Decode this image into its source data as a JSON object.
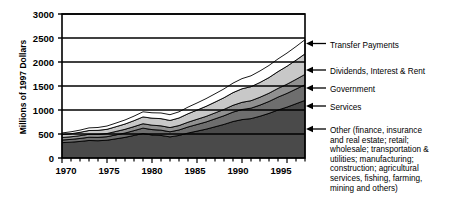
{
  "chart_data": {
    "type": "area",
    "stacked": true,
    "title": "",
    "xlabel": "",
    "ylabel": "Millions of 1997 Dollars",
    "xlim": [
      1970,
      1997
    ],
    "ylim": [
      0,
      3000
    ],
    "grid": true,
    "legend_position": "right-callout",
    "x": [
      1970,
      1971,
      1972,
      1973,
      1974,
      1975,
      1976,
      1977,
      1978,
      1979,
      1980,
      1981,
      1982,
      1983,
      1984,
      1985,
      1986,
      1987,
      1988,
      1989,
      1990,
      1991,
      1992,
      1993,
      1994,
      1995,
      1996,
      1997
    ],
    "y_ticks": [
      0,
      500,
      1000,
      1500,
      2000,
      2500,
      3000
    ],
    "x_ticks": [
      1970,
      1975,
      1980,
      1985,
      1990,
      1995
    ],
    "series": [
      {
        "name": "Other (finance, insurance and real estate; retail; wholesale; transportation & utilities; manufacturing; construction; agricultural services, fishing, farming, mining and others)",
        "short_name": "Other",
        "color": "#4a4a4a",
        "values": [
          320,
          330,
          345,
          365,
          360,
          370,
          400,
          430,
          470,
          510,
          480,
          470,
          440,
          470,
          520,
          560,
          600,
          650,
          700,
          760,
          800,
          820,
          870,
          930,
          1000,
          1060,
          1130,
          1200
        ]
      },
      {
        "name": "Services",
        "short_name": "Services",
        "color": "#6e6e6e",
        "values": [
          55,
          58,
          62,
          68,
          70,
          74,
          82,
          90,
          100,
          112,
          112,
          110,
          106,
          114,
          126,
          138,
          150,
          165,
          180,
          196,
          210,
          218,
          232,
          248,
          268,
          286,
          306,
          328
        ]
      },
      {
        "name": "Government",
        "short_name": "Government",
        "color": "#909090",
        "values": [
          52,
          54,
          58,
          62,
          64,
          66,
          72,
          78,
          84,
          92,
          92,
          90,
          88,
          92,
          100,
          108,
          116,
          124,
          132,
          142,
          150,
          156,
          164,
          172,
          182,
          192,
          202,
          214
        ]
      },
      {
        "name": "Dividends, Interest & Rent",
        "short_name": "Dividends, Interest & Rent",
        "color": "#c8c8c8",
        "values": [
          60,
          64,
          70,
          78,
          82,
          88,
          98,
          110,
          124,
          142,
          146,
          150,
          148,
          158,
          176,
          192,
          210,
          226,
          244,
          264,
          282,
          292,
          308,
          326,
          350,
          374,
          400,
          428
        ]
      },
      {
        "name": "Transfer Payments",
        "short_name": "Transfer Payments",
        "color": "#ffffff",
        "values": [
          35,
          40,
          46,
          54,
          60,
          68,
          76,
          84,
          94,
          106,
          112,
          118,
          120,
          128,
          138,
          148,
          160,
          172,
          184,
          198,
          212,
          226,
          240,
          252,
          264,
          274,
          284,
          295
        ]
      }
    ],
    "totals": [
      522,
      546,
      581,
      627,
      636,
      666,
      728,
      792,
      872,
      962,
      942,
      938,
      902,
      962,
      1060,
      1146,
      1236,
      1337,
      1440,
      1560,
      1654,
      1712,
      1814,
      1928,
      2064,
      2186,
      2322,
      2465
    ]
  },
  "axis": {
    "y_labels": [
      "3000",
      "2500",
      "2000",
      "1500",
      "1000",
      "500",
      "0"
    ],
    "x_labels": [
      "1970",
      "1975",
      "1980",
      "1985",
      "1990",
      "1995"
    ],
    "y_title": "Millions of 1997 Dollars"
  },
  "legend": {
    "items": [
      {
        "label": "Transfer Payments"
      },
      {
        "label": "Dividends, Interest & Rent"
      },
      {
        "label": "Government"
      },
      {
        "label": "Services"
      },
      {
        "label": "Other (finance, insurance\nand real estate; retail;\nwholesale; transportation &\nutilities; manufacturing;\nconstruction; agricultural\nservices, fishing, farming,\nmining and others)"
      }
    ]
  },
  "colors": {
    "other": "#4a4a4a",
    "services": "#6e6e6e",
    "government": "#909090",
    "dividends": "#c8c8c8",
    "transfer": "#ffffff",
    "axis": "#000000",
    "background": "#ffffff"
  }
}
